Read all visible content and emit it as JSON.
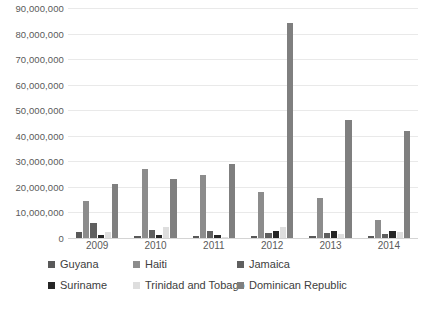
{
  "chart_data": {
    "type": "bar",
    "title": "",
    "xlabel": "",
    "ylabel": "",
    "ylim": [
      0,
      90000000
    ],
    "grid": true,
    "legend_position": "bottom",
    "categories": [
      "2009",
      "2010",
      "2011",
      "2012",
      "2013",
      "2014"
    ],
    "ytick_labels": [
      "90,000,000",
      "80,000,000",
      "70,000,000",
      "60,000,000",
      "50,000,000",
      "40,000,000",
      "30,000,000",
      "20,000,000",
      "10,000,000",
      "0"
    ],
    "ytick_values": [
      90000000,
      80000000,
      70000000,
      60000000,
      50000000,
      40000000,
      30000000,
      20000000,
      10000000,
      0
    ],
    "series": [
      {
        "name": "Guyana",
        "color": "#595959",
        "values": [
          2500000,
          900000,
          900000,
          700000,
          700000,
          700000
        ]
      },
      {
        "name": "Haiti",
        "color": "#8c8c8c",
        "values": [
          14500000,
          27000000,
          24500000,
          18000000,
          15500000,
          7000000
        ]
      },
      {
        "name": "Jamaica",
        "color": "#5f5f5f",
        "values": [
          6000000,
          3000000,
          2600000,
          2000000,
          2000000,
          1600000
        ]
      },
      {
        "name": "Suriname",
        "color": "#262626",
        "values": [
          1300000,
          1300000,
          1300000,
          2600000,
          2600000,
          2600000
        ]
      },
      {
        "name": "Trinidad and Tobago",
        "color": "#dedede",
        "values": [
          2500000,
          4300000,
          500000,
          4500000,
          1500000,
          2500000
        ]
      },
      {
        "name": "Dominican Republic",
        "color": "#7f7f7f",
        "values": [
          21000000,
          23000000,
          29000000,
          84000000,
          46000000,
          42000000
        ]
      }
    ]
  }
}
